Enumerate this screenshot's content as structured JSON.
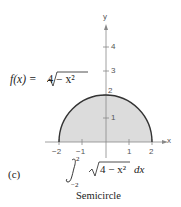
{
  "figure": {
    "function_label": "f(x) = √(4 − x²)",
    "function_label_parts": {
      "lhs": "f(x) = ",
      "radicand": "4 − x²"
    },
    "part_label": "(c)",
    "integral": {
      "lower": "−2",
      "upper": "2",
      "integrand": "4 − x²",
      "differential": "dx"
    },
    "caption": "Semicircle",
    "axis_labels": {
      "x": "x",
      "y": "y"
    },
    "x_ticks": [
      "−2",
      "−1",
      "1",
      "2"
    ],
    "y_ticks": [
      "1",
      "2",
      "3",
      "4"
    ],
    "colors": {
      "fill": "#dcdcdc",
      "curve": "#333333",
      "axis": "#888888"
    }
  }
}
